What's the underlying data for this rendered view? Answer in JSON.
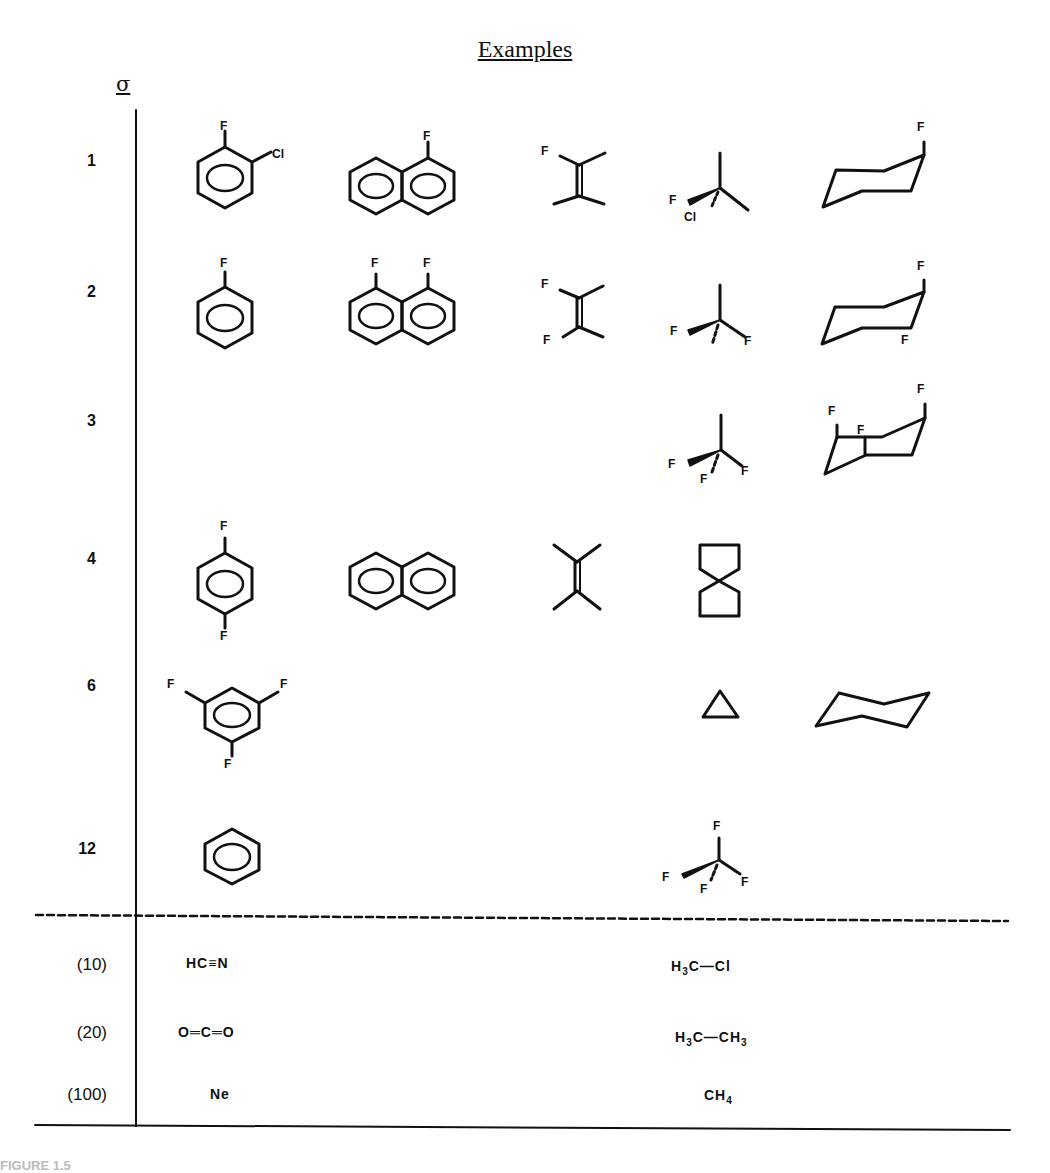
{
  "figure": {
    "title": "Examples",
    "column_header": "σ",
    "rows": [
      {
        "sigma": "1",
        "examples": [
          "2-chloro-1-fluorobenzene",
          "1-fluoronaphthalene",
          "1-fluoro-2-methylpropene (F, two CH3 on double bond)",
          "chlorofluoro-tert carbon (F, Cl, two methyls)",
          "axial fluorocyclohexane"
        ],
        "atom_labels": [
          "F",
          "Cl",
          "F",
          "F",
          "F",
          "Cl",
          "F"
        ]
      },
      {
        "sigma": "2",
        "examples": [
          "fluorobenzene",
          "1,8-difluoronaphthalene",
          "1,1-difluoroalkene",
          "difluoro carbon with methyl",
          "1,3-difluorocyclohexane (axial)"
        ],
        "atom_labels": [
          "F",
          "F",
          "F",
          "F",
          "F",
          "F",
          "F",
          "F",
          "F"
        ]
      },
      {
        "sigma": "3",
        "examples": [
          "trifluoromethyl group (CF3-)",
          "trifluoro bicyclic (decalin-like)"
        ],
        "atom_labels": [
          "F",
          "F",
          "F",
          "F",
          "F",
          "F"
        ]
      },
      {
        "sigma": "4",
        "examples": [
          "1,4-difluorobenzene",
          "naphthalene",
          "tetramethylethylene",
          "spiropentane-like (spiro[3.3]heptane)"
        ],
        "atom_labels": [
          "F",
          "F"
        ]
      },
      {
        "sigma": "6",
        "examples": [
          "1,3,5-trifluorobenzene",
          "cyclopropane",
          "cyclohexane (chair)"
        ],
        "atom_labels": [
          "F",
          "F",
          "F"
        ]
      },
      {
        "sigma": "12",
        "examples": [
          "benzene",
          "tetrafluoromethane (CF4)"
        ],
        "atom_labels": [
          "F",
          "F",
          "F",
          "F"
        ]
      }
    ],
    "reference_rows": [
      {
        "sigma": "(10)",
        "left_formula": "HC≡N",
        "right_formula_parts": [
          "H",
          "3",
          "C—Cl"
        ]
      },
      {
        "sigma": "(20)",
        "left_formula": "O═C═O",
        "right_formula_parts": [
          "H",
          "3",
          "C—CH",
          "3"
        ]
      },
      {
        "sigma": "(100)",
        "left_formula": "Ne",
        "right_formula_parts": [
          "CH",
          "4"
        ]
      }
    ],
    "caption_fragment": "FIGURE 1.5"
  },
  "colors": {
    "ink": "#111111",
    "background": "#ffffff"
  }
}
